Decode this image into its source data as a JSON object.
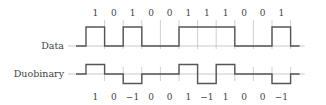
{
  "diagram": {
    "rows": [
      {
        "id": "data",
        "label": "Data"
      },
      {
        "id": "duobinary",
        "label": "Duobinary"
      }
    ],
    "data_bits": [
      "1",
      "0",
      "1",
      "0",
      "0",
      "1",
      "1",
      "1",
      "0",
      "0",
      "1"
    ],
    "duobinary_symbols": [
      "1",
      "0",
      "−1",
      "0",
      "0",
      "1",
      "−1",
      "1",
      "0",
      "0",
      "−1"
    ],
    "data_levels": [
      1,
      0,
      1,
      0,
      0,
      1,
      1,
      1,
      0,
      0,
      1
    ],
    "duobinary_levels": [
      1,
      0,
      -1,
      0,
      0,
      1,
      -1,
      1,
      0,
      0,
      -1
    ],
    "colors": {
      "waveform": "#555555",
      "axis": "#bbbbbb",
      "text": "#444444"
    }
  }
}
